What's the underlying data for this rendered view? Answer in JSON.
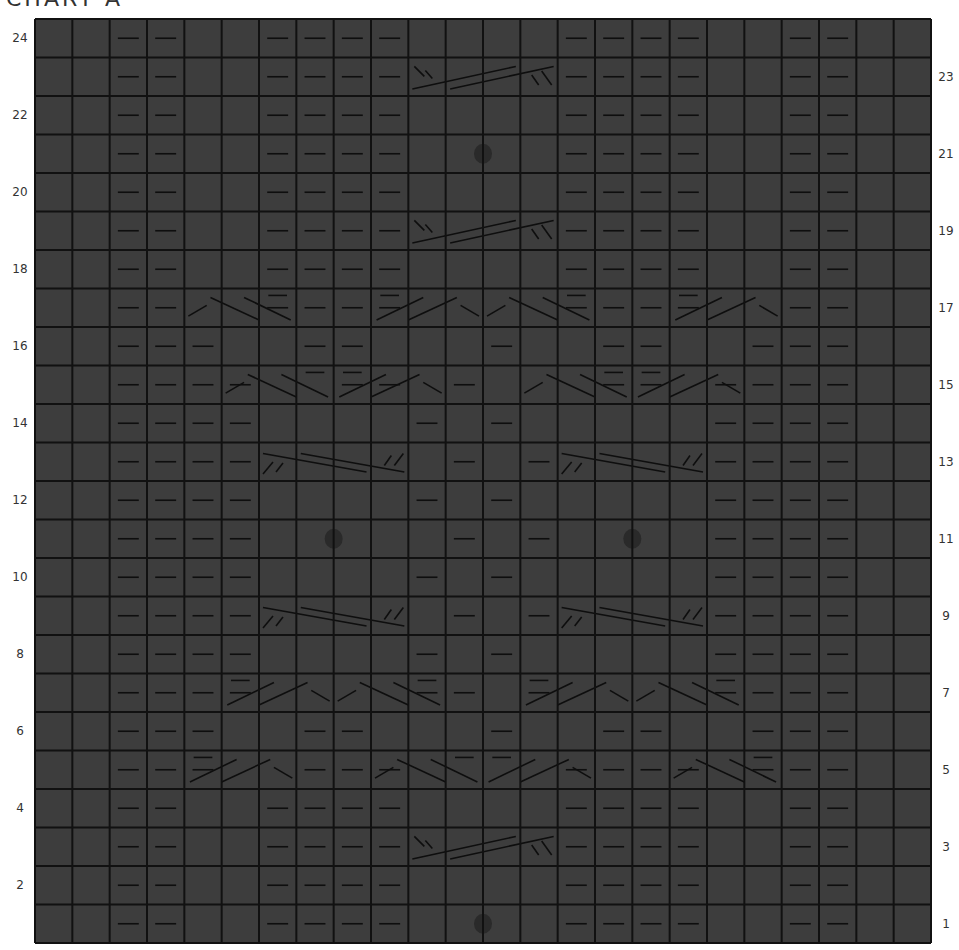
{
  "title": "CHART A",
  "grid": {
    "cols": 24,
    "rows": 24,
    "left": 35,
    "top": 19,
    "right": 931,
    "bottom": 943,
    "cell_fill": "#3d3d3d",
    "line_color": "#111111",
    "symbol_color": "#0e0e0e",
    "bobble_color": "#2a2a2a"
  },
  "row_labels_left": [
    2,
    4,
    6,
    8,
    10,
    12,
    14,
    16,
    18,
    20,
    22,
    24
  ],
  "row_labels_right": [
    1,
    3,
    5,
    7,
    9,
    11,
    13,
    15,
    17,
    19,
    21,
    23
  ],
  "legend_note": "Rows numbered bottom to top; even rows labeled left, odd rows labeled right.",
  "purls": {
    "24": [
      3,
      4,
      7,
      8,
      9,
      10,
      15,
      16,
      17,
      18,
      21,
      22
    ],
    "23": [
      3,
      4,
      7,
      8,
      9,
      10,
      15,
      16,
      17,
      18,
      21,
      22
    ],
    "22": [
      3,
      4,
      7,
      8,
      9,
      10,
      15,
      16,
      17,
      18,
      21,
      22
    ],
    "21": [
      3,
      4,
      7,
      8,
      9,
      10,
      15,
      16,
      17,
      18,
      21,
      22
    ],
    "20": [
      3,
      4,
      7,
      8,
      9,
      10,
      15,
      16,
      17,
      18,
      21,
      22
    ],
    "19": [
      3,
      4,
      7,
      8,
      9,
      10,
      15,
      16,
      17,
      18,
      21,
      22
    ],
    "18": [
      3,
      4,
      7,
      8,
      9,
      10,
      15,
      16,
      17,
      18,
      21,
      22
    ],
    "17": [
      3,
      4,
      7,
      8,
      9,
      10,
      15,
      16,
      17,
      18,
      21,
      22
    ],
    "16": [
      3,
      4,
      5,
      8,
      9,
      13,
      16,
      17,
      20,
      21,
      22
    ],
    "15": [
      3,
      4,
      5,
      6,
      9,
      10,
      12,
      16,
      17,
      19,
      20,
      21,
      22
    ],
    "14": [
      3,
      4,
      5,
      6,
      11,
      13,
      19,
      20,
      21,
      22
    ],
    "13": [
      3,
      4,
      5,
      6,
      12,
      14,
      19,
      20,
      21,
      22
    ],
    "12": [
      3,
      4,
      5,
      6,
      11,
      13,
      19,
      20,
      21,
      22
    ],
    "11": [
      3,
      4,
      5,
      6,
      12,
      14,
      19,
      20,
      21,
      22
    ],
    "10": [
      3,
      4,
      5,
      6,
      11,
      13,
      19,
      20,
      21,
      22
    ],
    "9": [
      3,
      4,
      5,
      6,
      12,
      14,
      19,
      20,
      21,
      22
    ],
    "8": [
      3,
      4,
      5,
      6,
      11,
      13,
      19,
      20,
      21,
      22
    ],
    "7": [
      3,
      4,
      5,
      6,
      11,
      12,
      14,
      19,
      20,
      21,
      22
    ],
    "6": [
      3,
      4,
      5,
      8,
      9,
      13,
      16,
      17,
      20,
      21,
      22
    ],
    "5": [
      3,
      4,
      5,
      8,
      9,
      10,
      15,
      16,
      17,
      18,
      20,
      21,
      22
    ],
    "4": [
      3,
      4,
      7,
      8,
      9,
      10,
      15,
      16,
      17,
      18,
      21,
      22
    ],
    "3": [
      3,
      4,
      7,
      8,
      9,
      10,
      15,
      16,
      17,
      18,
      21,
      22
    ],
    "2": [
      3,
      4,
      7,
      8,
      9,
      10,
      15,
      16,
      17,
      18,
      21,
      22
    ],
    "1": [
      3,
      4,
      7,
      8,
      9,
      10,
      15,
      16,
      17,
      18,
      21,
      22
    ]
  },
  "bobbles": [
    {
      "row": 1,
      "col_boundary": 12
    },
    {
      "row": 21,
      "col_boundary": 12
    },
    {
      "row": 11,
      "col_boundary": 8
    },
    {
      "row": 11,
      "col_boundary": 16
    }
  ],
  "cables": [
    {
      "row": 23,
      "start_col": 11,
      "span": 4,
      "type": "right-cross-4"
    },
    {
      "row": 19,
      "start_col": 11,
      "span": 4,
      "type": "right-cross-4"
    },
    {
      "row": 3,
      "start_col": 11,
      "span": 4,
      "type": "right-cross-4"
    },
    {
      "row": 13,
      "start_col": 7,
      "span": 4,
      "type": "left-cross-4"
    },
    {
      "row": 13,
      "start_col": 15,
      "span": 4,
      "type": "left-cross-4"
    },
    {
      "row": 9,
      "start_col": 7,
      "span": 4,
      "type": "left-cross-4"
    },
    {
      "row": 9,
      "start_col": 15,
      "span": 4,
      "type": "left-cross-4"
    },
    {
      "row": 17,
      "start_col": 5,
      "span": 3,
      "type": "travel-left"
    },
    {
      "row": 17,
      "start_col": 10,
      "span": 3,
      "type": "travel-right"
    },
    {
      "row": 17,
      "start_col": 13,
      "span": 3,
      "type": "travel-left"
    },
    {
      "row": 17,
      "start_col": 18,
      "span": 3,
      "type": "travel-right"
    },
    {
      "row": 15,
      "start_col": 6,
      "span": 3,
      "type": "travel-left"
    },
    {
      "row": 15,
      "start_col": 9,
      "span": 3,
      "type": "travel-right"
    },
    {
      "row": 15,
      "start_col": 14,
      "span": 3,
      "type": "travel-left"
    },
    {
      "row": 15,
      "start_col": 17,
      "span": 3,
      "type": "travel-right"
    },
    {
      "row": 7,
      "start_col": 6,
      "span": 3,
      "type": "travel-right"
    },
    {
      "row": 7,
      "start_col": 9,
      "span": 3,
      "type": "travel-left"
    },
    {
      "row": 7,
      "start_col": 14,
      "span": 3,
      "type": "travel-right"
    },
    {
      "row": 7,
      "start_col": 17,
      "span": 3,
      "type": "travel-left"
    },
    {
      "row": 5,
      "start_col": 5,
      "span": 3,
      "type": "travel-right"
    },
    {
      "row": 5,
      "start_col": 10,
      "span": 3,
      "type": "travel-left"
    },
    {
      "row": 5,
      "start_col": 13,
      "span": 3,
      "type": "travel-right"
    },
    {
      "row": 5,
      "start_col": 18,
      "span": 3,
      "type": "travel-left"
    }
  ]
}
